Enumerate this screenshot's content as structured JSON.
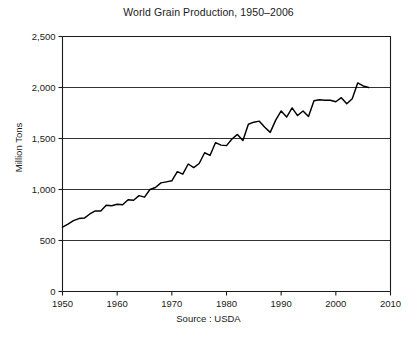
{
  "chart_data": {
    "type": "line",
    "title": "World Grain Production, 1950–2006",
    "xlabel": "",
    "ylabel": "Million Tons",
    "source": "Source : USDA",
    "xlim": [
      1950,
      2010
    ],
    "ylim": [
      0,
      2500
    ],
    "xticks": [
      1950,
      1960,
      1970,
      1980,
      1990,
      2000,
      2010
    ],
    "xtick_labels": [
      "1950",
      "1960",
      "1970",
      "1980",
      "1990",
      "2000",
      "2010"
    ],
    "yticks": [
      0,
      500,
      1000,
      1500,
      2000,
      2500
    ],
    "ytick_labels": [
      "0",
      "500",
      "1,000",
      "1,500",
      "2,000",
      "2,500"
    ],
    "grid": true,
    "grid_axis": "y",
    "legend": false,
    "line_color": "#000000",
    "series": [
      {
        "name": "World Grain Production",
        "x": [
          1950,
          1951,
          1952,
          1953,
          1954,
          1955,
          1956,
          1957,
          1958,
          1959,
          1960,
          1961,
          1962,
          1963,
          1964,
          1965,
          1966,
          1967,
          1968,
          1969,
          1970,
          1971,
          1972,
          1973,
          1974,
          1975,
          1976,
          1977,
          1978,
          1979,
          1980,
          1981,
          1982,
          1983,
          1984,
          1985,
          1986,
          1987,
          1988,
          1989,
          1990,
          1991,
          1992,
          1993,
          1994,
          1995,
          1996,
          1997,
          1998,
          1999,
          2000,
          2001,
          2002,
          2003,
          2004,
          2005,
          2006
        ],
        "values": [
          631,
          660,
          695,
          715,
          720,
          760,
          790,
          790,
          845,
          840,
          855,
          850,
          900,
          895,
          940,
          925,
          1000,
          1020,
          1065,
          1075,
          1085,
          1175,
          1150,
          1250,
          1215,
          1255,
          1360,
          1335,
          1460,
          1435,
          1430,
          1495,
          1540,
          1480,
          1640,
          1660,
          1670,
          1610,
          1560,
          1680,
          1770,
          1710,
          1800,
          1725,
          1770,
          1715,
          1870,
          1880,
          1875,
          1875,
          1860,
          1900,
          1840,
          1890,
          2045,
          2015,
          2000
        ]
      }
    ]
  },
  "axis_titles": {
    "y": "Million Tons"
  }
}
